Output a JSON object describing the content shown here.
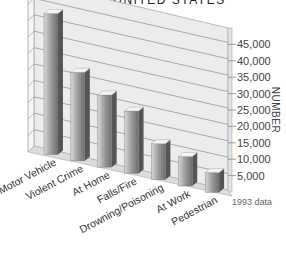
{
  "chart_data": {
    "type": "bar",
    "title": "IN THE UNITED STATES",
    "xlabel": "",
    "ylabel": "NUMBER",
    "categories": [
      "Motor Vehicle",
      "Violent Crime",
      "At Home",
      "Falls/Fire",
      "Drowning/Poisoning",
      "At Work",
      "Pedestrian"
    ],
    "values": [
      43000,
      27000,
      22000,
      19000,
      11000,
      9000,
      6000
    ],
    "ylim": [
      0,
      50000
    ],
    "yticks": [
      "5,000",
      "10,000",
      "15,000",
      "20,000",
      "25,000",
      "30,000",
      "35,000",
      "40,000",
      "45,000"
    ],
    "annotation": "1993 data",
    "grid": true,
    "style": "3d"
  }
}
